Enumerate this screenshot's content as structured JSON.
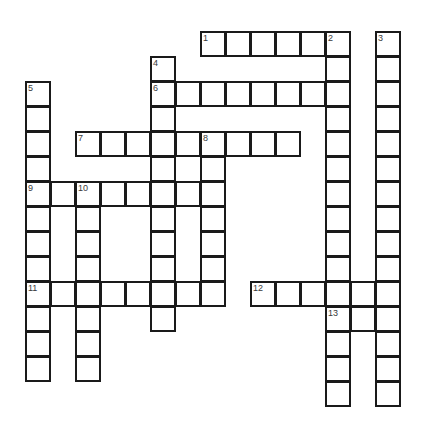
{
  "puzzle": {
    "title": "Crossword Grid",
    "cell_size_px": 25,
    "origin_x_px": 25,
    "origin_y_px": 31,
    "columns": 15,
    "rows": 16,
    "grid_color": "#1a1a1a",
    "cell_background": "#ffffff",
    "page_background": "#ffffff",
    "number_color": "#3a3a3a",
    "entries": [
      {
        "number": "1",
        "direction": "across",
        "row": 0,
        "col": 7,
        "length": 6
      },
      {
        "number": "2",
        "direction": "down",
        "row": 0,
        "col": 12,
        "length": 12
      },
      {
        "number": "3",
        "direction": "down",
        "row": 0,
        "col": 14,
        "length": 16
      },
      {
        "number": "4",
        "direction": "down",
        "row": 1,
        "col": 5,
        "length": 12
      },
      {
        "number": "5",
        "direction": "down",
        "row": 2,
        "col": 0,
        "length": 14
      },
      {
        "number": "6",
        "direction": "across",
        "row": 2,
        "col": 5,
        "length": 8
      },
      {
        "number": "7",
        "direction": "across",
        "row": 4,
        "col": 2,
        "length": 9
      },
      {
        "number": "8",
        "direction": "down",
        "row": 4,
        "col": 7,
        "length": 8
      },
      {
        "number": "9",
        "direction": "across",
        "row": 6,
        "col": 0,
        "length": 8
      },
      {
        "number": "10",
        "direction": "down",
        "row": 6,
        "col": 2,
        "length": 10
      },
      {
        "number": "11",
        "direction": "across",
        "row": 10,
        "col": 0,
        "length": 8
      },
      {
        "number": "12",
        "direction": "across",
        "row": 10,
        "col": 9,
        "length": 6
      },
      {
        "number": "13",
        "direction": "across",
        "row": 11,
        "col": 12,
        "length": 3
      }
    ],
    "numbered_cells": [
      {
        "number": "1",
        "row": 0,
        "col": 7
      },
      {
        "number": "2",
        "row": 0,
        "col": 12
      },
      {
        "number": "3",
        "row": 0,
        "col": 14
      },
      {
        "number": "4",
        "row": 1,
        "col": 5
      },
      {
        "number": "5",
        "row": 2,
        "col": 0
      },
      {
        "number": "6",
        "row": 2,
        "col": 5
      },
      {
        "number": "7",
        "row": 4,
        "col": 2
      },
      {
        "number": "8",
        "row": 4,
        "col": 7
      },
      {
        "number": "9",
        "row": 6,
        "col": 0
      },
      {
        "number": "10",
        "row": 6,
        "col": 2
      },
      {
        "number": "11",
        "row": 10,
        "col": 0
      },
      {
        "number": "12",
        "row": 10,
        "col": 9
      },
      {
        "number": "13",
        "row": 11,
        "col": 12
      }
    ],
    "cells": [
      {
        "row": 0,
        "col": 7
      },
      {
        "row": 0,
        "col": 8
      },
      {
        "row": 0,
        "col": 9
      },
      {
        "row": 0,
        "col": 10
      },
      {
        "row": 0,
        "col": 11
      },
      {
        "row": 0,
        "col": 12
      },
      {
        "row": 0,
        "col": 14
      },
      {
        "row": 1,
        "col": 5
      },
      {
        "row": 1,
        "col": 12
      },
      {
        "row": 1,
        "col": 14
      },
      {
        "row": 2,
        "col": 0
      },
      {
        "row": 2,
        "col": 5
      },
      {
        "row": 2,
        "col": 6
      },
      {
        "row": 2,
        "col": 7
      },
      {
        "row": 2,
        "col": 8
      },
      {
        "row": 2,
        "col": 9
      },
      {
        "row": 2,
        "col": 10
      },
      {
        "row": 2,
        "col": 11
      },
      {
        "row": 2,
        "col": 12
      },
      {
        "row": 2,
        "col": 14
      },
      {
        "row": 3,
        "col": 0
      },
      {
        "row": 3,
        "col": 5
      },
      {
        "row": 3,
        "col": 12
      },
      {
        "row": 3,
        "col": 14
      },
      {
        "row": 4,
        "col": 0
      },
      {
        "row": 4,
        "col": 2
      },
      {
        "row": 4,
        "col": 3
      },
      {
        "row": 4,
        "col": 4
      },
      {
        "row": 4,
        "col": 5
      },
      {
        "row": 4,
        "col": 6
      },
      {
        "row": 4,
        "col": 7
      },
      {
        "row": 4,
        "col": 8
      },
      {
        "row": 4,
        "col": 9
      },
      {
        "row": 4,
        "col": 10
      },
      {
        "row": 4,
        "col": 12
      },
      {
        "row": 4,
        "col": 14
      },
      {
        "row": 5,
        "col": 0
      },
      {
        "row": 5,
        "col": 5
      },
      {
        "row": 5,
        "col": 7
      },
      {
        "row": 5,
        "col": 12
      },
      {
        "row": 5,
        "col": 14
      },
      {
        "row": 6,
        "col": 0
      },
      {
        "row": 6,
        "col": 1
      },
      {
        "row": 6,
        "col": 2
      },
      {
        "row": 6,
        "col": 3
      },
      {
        "row": 6,
        "col": 4
      },
      {
        "row": 6,
        "col": 5
      },
      {
        "row": 6,
        "col": 6
      },
      {
        "row": 6,
        "col": 7
      },
      {
        "row": 6,
        "col": 12
      },
      {
        "row": 6,
        "col": 14
      },
      {
        "row": 7,
        "col": 0
      },
      {
        "row": 7,
        "col": 2
      },
      {
        "row": 7,
        "col": 5
      },
      {
        "row": 7,
        "col": 7
      },
      {
        "row": 7,
        "col": 12
      },
      {
        "row": 7,
        "col": 14
      },
      {
        "row": 8,
        "col": 0
      },
      {
        "row": 8,
        "col": 2
      },
      {
        "row": 8,
        "col": 5
      },
      {
        "row": 8,
        "col": 7
      },
      {
        "row": 8,
        "col": 12
      },
      {
        "row": 8,
        "col": 14
      },
      {
        "row": 9,
        "col": 0
      },
      {
        "row": 9,
        "col": 2
      },
      {
        "row": 9,
        "col": 5
      },
      {
        "row": 9,
        "col": 7
      },
      {
        "row": 9,
        "col": 12
      },
      {
        "row": 9,
        "col": 14
      },
      {
        "row": 10,
        "col": 0
      },
      {
        "row": 10,
        "col": 1
      },
      {
        "row": 10,
        "col": 2
      },
      {
        "row": 10,
        "col": 3
      },
      {
        "row": 10,
        "col": 4
      },
      {
        "row": 10,
        "col": 5
      },
      {
        "row": 10,
        "col": 6
      },
      {
        "row": 10,
        "col": 7
      },
      {
        "row": 10,
        "col": 9
      },
      {
        "row": 10,
        "col": 10
      },
      {
        "row": 10,
        "col": 11
      },
      {
        "row": 10,
        "col": 12
      },
      {
        "row": 10,
        "col": 13
      },
      {
        "row": 10,
        "col": 14
      },
      {
        "row": 11,
        "col": 0
      },
      {
        "row": 11,
        "col": 2
      },
      {
        "row": 11,
        "col": 5
      },
      {
        "row": 11,
        "col": 12
      },
      {
        "row": 11,
        "col": 13
      },
      {
        "row": 11,
        "col": 14
      },
      {
        "row": 12,
        "col": 0
      },
      {
        "row": 12,
        "col": 2
      },
      {
        "row": 12,
        "col": 12
      },
      {
        "row": 12,
        "col": 14
      },
      {
        "row": 13,
        "col": 0
      },
      {
        "row": 13,
        "col": 2
      },
      {
        "row": 13,
        "col": 12
      },
      {
        "row": 13,
        "col": 14
      },
      {
        "row": 14,
        "col": 12
      },
      {
        "row": 14,
        "col": 14
      }
    ]
  }
}
